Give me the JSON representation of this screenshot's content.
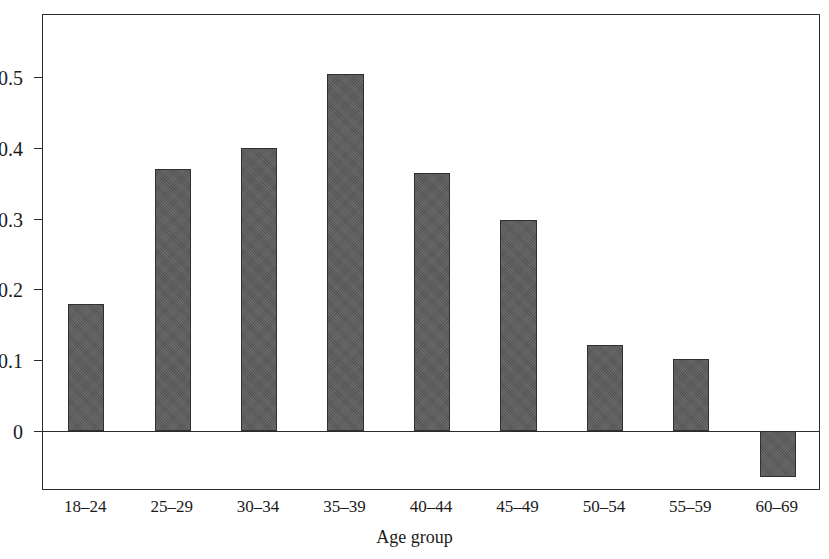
{
  "chart_data": {
    "type": "bar",
    "title": "",
    "subtitle": "",
    "xlabel": "Age group",
    "ylabel": "",
    "categories": [
      "18–24",
      "25–29",
      "30–34",
      "35–39",
      "40–44",
      "45–49",
      "50–54",
      "55–59",
      "60–69"
    ],
    "values": [
      0.18,
      0.37,
      0.4,
      0.505,
      0.365,
      0.298,
      0.122,
      0.102,
      -0.065
    ],
    "ylim": [
      -0.085,
      0.588
    ],
    "xlim": [
      0,
      9
    ],
    "yticks": [
      0,
      0.1,
      0.2,
      0.3,
      0.4,
      0.5
    ],
    "ytick_labels": [
      "0",
      "0.1",
      "0.2",
      "0.3",
      "0.4",
      "0.5"
    ],
    "grid": false,
    "legend": null,
    "legend_position": "none",
    "bar_color": "#5c5c5c",
    "bar_edge_color": "#303030",
    "axis_color": "#2b2b2b",
    "background_color": "#ffffff",
    "annotations": []
  },
  "axes": {
    "x_axis_title": "Age group"
  }
}
